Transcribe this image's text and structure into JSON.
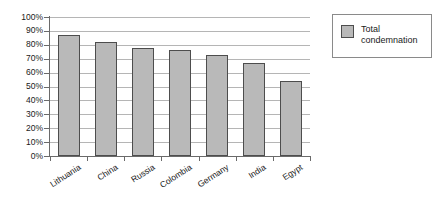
{
  "chart_data": {
    "type": "bar",
    "title": "",
    "subtitle": "",
    "xlabel": "",
    "ylabel": "",
    "categories": [
      "Lithuania",
      "China",
      "Russia",
      "Colombia",
      "Germany",
      "India",
      "Egypt"
    ],
    "series": [
      {
        "name": "Total condemnation",
        "values": [
          87,
          82,
          78,
          76,
          73,
          67,
          54
        ]
      }
    ],
    "values": [
      87,
      82,
      78,
      76,
      73,
      67,
      54
    ],
    "ylim": [
      0,
      100
    ],
    "ytick_values": [
      0,
      10,
      20,
      30,
      40,
      50,
      60,
      70,
      80,
      90,
      100
    ],
    "ytick_labels": [
      "0%",
      "10%",
      "20%",
      "30%",
      "40%",
      "50%",
      "60%",
      "70%",
      "80%",
      "90%",
      "100%"
    ],
    "grid": true,
    "grid_axis": "y",
    "legend_position": "right-outside",
    "legend_entries": [
      "Total condemnation"
    ],
    "value_format": "percent",
    "colors": {
      "bar_fill": "#b9b9b9",
      "bar_border": "#4d4d4d",
      "gridline": "#b5b5b5",
      "axis_line": "#6a6a6a",
      "legend_border": "#8a8a8a",
      "background": "#ffffff",
      "text": "#1a1a1a"
    }
  },
  "legend": {
    "entry_label": "Total condemnation"
  }
}
